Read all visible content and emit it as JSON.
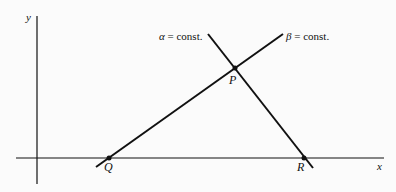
{
  "diagram": {
    "axes": {
      "x_label": "x",
      "y_label": "y"
    },
    "lines": [
      {
        "id": "alpha",
        "label_symbol": "α",
        "label_rest": " = const."
      },
      {
        "id": "beta",
        "label_symbol": "β",
        "label_rest": " = const."
      }
    ],
    "points": {
      "P": "P",
      "Q": "Q",
      "R": "R"
    },
    "colors": {
      "ink": "#111111",
      "background": "#fbfbfb"
    }
  }
}
